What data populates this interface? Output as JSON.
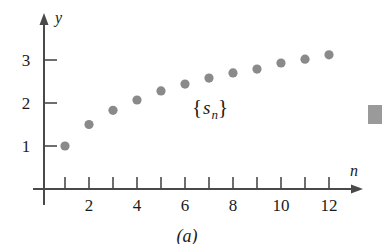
{
  "chart_data": {
    "type": "scatter",
    "title": "",
    "subtitle": "",
    "xlabel": "n",
    "ylabel": "y",
    "caption": "(a)",
    "series_label": "{s_n}",
    "series_label_parts": {
      "open_brace": "{",
      "symbol": "s",
      "subscript": "n",
      "close_brace": "}"
    },
    "legend": "none",
    "grid": false,
    "x": [
      1,
      2,
      3,
      4,
      5,
      6,
      7,
      8,
      9,
      10,
      11,
      12
    ],
    "values": [
      1.0,
      1.5,
      1.83,
      2.07,
      2.28,
      2.44,
      2.58,
      2.7,
      2.79,
      2.93,
      3.02,
      3.12
    ],
    "series": [
      {
        "name": "{s_n}",
        "values": [
          1.0,
          1.5,
          1.83,
          2.07,
          2.28,
          2.44,
          2.58,
          2.7,
          2.79,
          2.93,
          3.02,
          3.12
        ]
      }
    ],
    "xlim": [
      0,
      13.2
    ],
    "ylim": [
      0,
      3.6
    ],
    "x_ticks": [
      1,
      2,
      3,
      4,
      5,
      6,
      7,
      8,
      9,
      10,
      11,
      12
    ],
    "x_tick_labels": [
      "",
      "2",
      "",
      "4",
      "",
      "6",
      "",
      "8",
      "",
      "10",
      "",
      "12"
    ],
    "y_ticks": [
      1,
      2,
      3
    ],
    "y_tick_labels": [
      "1",
      "2",
      "3"
    ],
    "marker": "filled-circle",
    "marker_color": "#8a8a8a",
    "axis_color": "#4a4a4a",
    "text_color": "#1a1a1a"
  },
  "axes": {
    "y_axis_name": "y",
    "x_axis_name": "n"
  },
  "ticks": {
    "y": [
      {
        "label": "3",
        "value": 3
      },
      {
        "label": "2",
        "value": 2
      },
      {
        "label": "1",
        "value": 1
      }
    ],
    "x": [
      {
        "label": "2",
        "value": 2
      },
      {
        "label": "4",
        "value": 4
      },
      {
        "label": "6",
        "value": 6
      },
      {
        "label": "8",
        "value": 8
      },
      {
        "label": "10",
        "value": 10
      },
      {
        "label": "12",
        "value": 12
      }
    ]
  },
  "caption": "(a)"
}
